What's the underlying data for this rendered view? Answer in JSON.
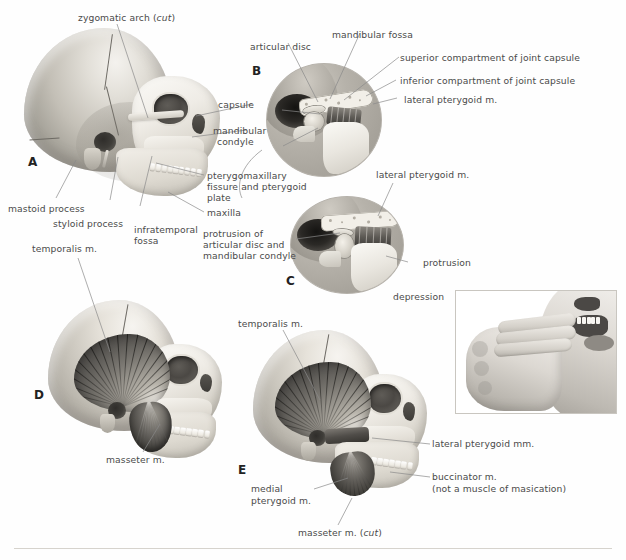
{
  "plate": {
    "title": "Temporomandibular joint and muscles of mastication",
    "panel_letters": [
      "A",
      "B",
      "C",
      "D",
      "E"
    ],
    "line_color": "#8a8a8a",
    "text_color": "#4a4a4a"
  },
  "panelA": {
    "letter": "A",
    "labels": {
      "zygomatic_arch": "zygomatic arch (",
      "zygomatic_arch_italic": "cut",
      "zygomatic_arch_end": ")",
      "mastoid_process": "mastoid process",
      "styloid_process": "styloid process",
      "infratemporal_fossa_1": "infratemporal",
      "infratemporal_fossa_2": "fossa",
      "capsule": "capsule",
      "mandibular_condyle_1": "mandibular",
      "mandibular_condyle_2": "condyle",
      "pterygomaxillary_1": "pterygomaxillary",
      "pterygomaxillary_2": "fissure and pterygoid",
      "pterygomaxillary_3": "plate",
      "maxilla": "maxilla"
    }
  },
  "panelB": {
    "letter": "B",
    "labels": {
      "articular_disc": "articular disc",
      "mandibular_fossa": "mandibular fossa",
      "superior_compartment": "superior compartment of joint capsule",
      "inferior_compartment": "inferior compartment of joint capsule",
      "lateral_pterygoid": "lateral pterygoid m."
    }
  },
  "panelC": {
    "letter": "C",
    "labels": {
      "lateral_pterygoid": "lateral pterygoid m.",
      "protrusion_of_1": "protrusion of",
      "protrusion_of_2": "articular disc and",
      "protrusion_of_3": "mandibular condyle",
      "protrusion": "protrusion",
      "depression": "depression"
    }
  },
  "panelD": {
    "letter": "D",
    "labels": {
      "temporalis": "temporalis m.",
      "masseter": "masseter m."
    }
  },
  "panelE": {
    "letter": "E",
    "labels": {
      "temporalis": "temporalis m.",
      "lateral_pterygoid": "lateral pterygoid mm.",
      "buccinator_1": "buccinator m.",
      "buccinator_2": "(not a muscle of masication)",
      "medial_pterygoid_1": "medial",
      "medial_pterygoid_2": "pterygoid m.",
      "masseter_cut_pre": "masseter m. (",
      "masseter_cut_italic": "cut",
      "masseter_cut_post": ")"
    }
  },
  "photo_inset": {
    "caption": "",
    "description": "fingers inserted between teeth demonstrating jaw opening"
  }
}
